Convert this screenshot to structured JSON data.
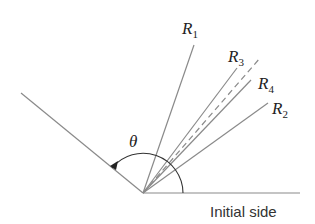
{
  "diagram": {
    "vertex": {
      "x": 143,
      "y": 193
    },
    "initial_side": {
      "label": "Initial side",
      "end": {
        "x": 300,
        "y": 193
      }
    },
    "terminal_side": {
      "end": {
        "x": 21,
        "y": 93
      }
    },
    "angle": {
      "symbol": "θ",
      "arc_radius": 40
    },
    "rays": [
      {
        "name": "R",
        "subscript": "1",
        "end": {
          "x": 194,
          "y": 45
        },
        "style": "solid"
      },
      {
        "name": "R",
        "subscript": "3",
        "end": {
          "x": 237,
          "y": 68
        },
        "style": "solid"
      },
      {
        "name": "",
        "subscript": "",
        "end": {
          "x": 260,
          "y": 58
        },
        "style": "dashed"
      },
      {
        "name": "R",
        "subscript": "4",
        "end": {
          "x": 251,
          "y": 80
        },
        "style": "solid"
      },
      {
        "name": "R",
        "subscript": "2",
        "end": {
          "x": 268,
          "y": 103
        },
        "style": "solid"
      }
    ],
    "colors": {
      "ray": "#8a8a8a",
      "arc": "#333333",
      "text": "#222222"
    }
  }
}
